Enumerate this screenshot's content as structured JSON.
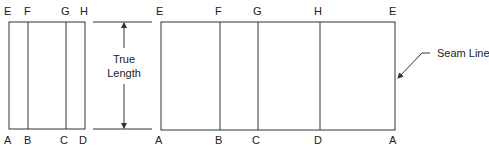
{
  "figure": {
    "left_pattern": {
      "top_labels": [
        "E",
        "F",
        "G",
        "H"
      ],
      "bottom_labels": [
        "A",
        "B",
        "C",
        "D"
      ]
    },
    "dimension": {
      "label_line1": "True",
      "label_line2": "Length"
    },
    "right_pattern": {
      "top_labels": [
        "E",
        "F",
        "G",
        "H",
        "E"
      ],
      "bottom_labels": [
        "A",
        "B",
        "C",
        "D",
        "A"
      ]
    },
    "callout": {
      "label": "Seam Line"
    }
  }
}
